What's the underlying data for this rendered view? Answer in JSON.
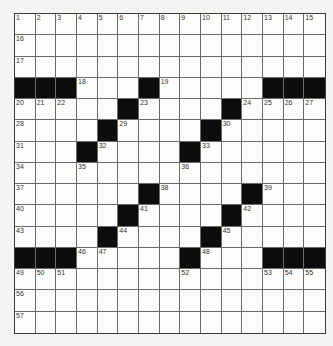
{
  "puzzle": {
    "rows": 15,
    "cols": 15,
    "colors": {
      "black": "#0c0c0c",
      "white": "#fdfdfb",
      "line": "#6a6a6a"
    },
    "black_squares": [
      [
        3,
        0
      ],
      [
        3,
        1
      ],
      [
        3,
        2
      ],
      [
        3,
        6
      ],
      [
        3,
        12
      ],
      [
        3,
        13
      ],
      [
        3,
        14
      ],
      [
        4,
        5
      ],
      [
        4,
        10
      ],
      [
        5,
        4
      ],
      [
        5,
        9
      ],
      [
        6,
        3
      ],
      [
        6,
        8
      ],
      [
        8,
        6
      ],
      [
        8,
        11
      ],
      [
        9,
        5
      ],
      [
        9,
        10
      ],
      [
        10,
        4
      ],
      [
        10,
        9
      ],
      [
        11,
        0
      ],
      [
        11,
        1
      ],
      [
        11,
        2
      ],
      [
        11,
        8
      ],
      [
        11,
        12
      ],
      [
        11,
        13
      ],
      [
        11,
        14
      ]
    ],
    "numbers": [
      {
        "r": 0,
        "c": 0,
        "n": "1"
      },
      {
        "r": 0,
        "c": 1,
        "n": "2"
      },
      {
        "r": 0,
        "c": 2,
        "n": "3"
      },
      {
        "r": 0,
        "c": 3,
        "n": "4"
      },
      {
        "r": 0,
        "c": 4,
        "n": "5"
      },
      {
        "r": 0,
        "c": 5,
        "n": "6"
      },
      {
        "r": 0,
        "c": 6,
        "n": "7"
      },
      {
        "r": 0,
        "c": 7,
        "n": "8"
      },
      {
        "r": 0,
        "c": 8,
        "n": "9"
      },
      {
        "r": 0,
        "c": 9,
        "n": "10"
      },
      {
        "r": 0,
        "c": 10,
        "n": "11"
      },
      {
        "r": 0,
        "c": 11,
        "n": "12"
      },
      {
        "r": 0,
        "c": 12,
        "n": "13"
      },
      {
        "r": 0,
        "c": 13,
        "n": "14"
      },
      {
        "r": 0,
        "c": 14,
        "n": "15"
      },
      {
        "r": 1,
        "c": 0,
        "n": "16"
      },
      {
        "r": 2,
        "c": 0,
        "n": "17"
      },
      {
        "r": 3,
        "c": 3,
        "n": "18"
      },
      {
        "r": 3,
        "c": 7,
        "n": "19"
      },
      {
        "r": 4,
        "c": 0,
        "n": "20"
      },
      {
        "r": 4,
        "c": 1,
        "n": "21"
      },
      {
        "r": 4,
        "c": 2,
        "n": "22"
      },
      {
        "r": 4,
        "c": 6,
        "n": "23"
      },
      {
        "r": 4,
        "c": 11,
        "n": "24"
      },
      {
        "r": 4,
        "c": 12,
        "n": "25"
      },
      {
        "r": 4,
        "c": 13,
        "n": "26"
      },
      {
        "r": 4,
        "c": 14,
        "n": "27"
      },
      {
        "r": 5,
        "c": 0,
        "n": "28"
      },
      {
        "r": 5,
        "c": 5,
        "n": "29"
      },
      {
        "r": 5,
        "c": 10,
        "n": "30"
      },
      {
        "r": 6,
        "c": 0,
        "n": "31"
      },
      {
        "r": 6,
        "c": 4,
        "n": "32"
      },
      {
        "r": 6,
        "c": 9,
        "n": "33"
      },
      {
        "r": 7,
        "c": 0,
        "n": "34"
      },
      {
        "r": 7,
        "c": 3,
        "n": "35"
      },
      {
        "r": 7,
        "c": 8,
        "n": "36"
      },
      {
        "r": 8,
        "c": 0,
        "n": "37"
      },
      {
        "r": 8,
        "c": 7,
        "n": "38"
      },
      {
        "r": 8,
        "c": 12,
        "n": "39"
      },
      {
        "r": 9,
        "c": 0,
        "n": "40"
      },
      {
        "r": 9,
        "c": 6,
        "n": "41"
      },
      {
        "r": 9,
        "c": 11,
        "n": "42"
      },
      {
        "r": 10,
        "c": 0,
        "n": "43"
      },
      {
        "r": 10,
        "c": 5,
        "n": "44"
      },
      {
        "r": 10,
        "c": 10,
        "n": "45"
      },
      {
        "r": 11,
        "c": 3,
        "n": "46"
      },
      {
        "r": 11,
        "c": 4,
        "n": "47"
      },
      {
        "r": 11,
        "c": 9,
        "n": "48"
      },
      {
        "r": 12,
        "c": 0,
        "n": "49"
      },
      {
        "r": 12,
        "c": 1,
        "n": "50"
      },
      {
        "r": 12,
        "c": 2,
        "n": "51"
      },
      {
        "r": 12,
        "c": 8,
        "n": "52"
      },
      {
        "r": 12,
        "c": 12,
        "n": "53"
      },
      {
        "r": 12,
        "c": 13,
        "n": "54"
      },
      {
        "r": 12,
        "c": 14,
        "n": "55"
      },
      {
        "r": 13,
        "c": 0,
        "n": "56"
      },
      {
        "r": 14,
        "c": 0,
        "n": "57"
      }
    ]
  }
}
